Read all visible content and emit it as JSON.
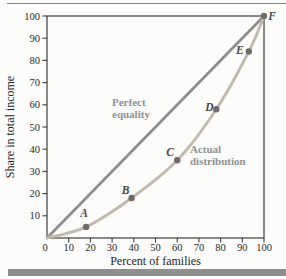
{
  "figure": {
    "background": "#fcfcfb",
    "top_rule_color": "#858585",
    "bottom_bar_color": "#8e8e8e"
  },
  "chart_data": {
    "type": "line",
    "title": "",
    "xlabel": "Percent of families",
    "ylabel": "Share in total income",
    "xlim": [
      0,
      100
    ],
    "ylim": [
      0,
      100
    ],
    "grid": false,
    "frame": true,
    "legend_position": "none",
    "xticks": [
      0,
      10,
      20,
      30,
      40,
      50,
      60,
      70,
      80,
      90,
      100
    ],
    "yticks": [
      10,
      20,
      30,
      40,
      50,
      60,
      70,
      80,
      90,
      100
    ],
    "series": [
      {
        "name": "Perfect equality",
        "shape": "straight-line",
        "color": "#8d8d8d",
        "points": [
          [
            0,
            0
          ],
          [
            100,
            100
          ]
        ]
      },
      {
        "name": "Actual distribution",
        "shape": "curve",
        "color": "#c1bbae",
        "points": [
          [
            0,
            0
          ],
          [
            18,
            5
          ],
          [
            39,
            18
          ],
          [
            60,
            35
          ],
          [
            78,
            58
          ],
          [
            93,
            84
          ],
          [
            100,
            100
          ]
        ]
      }
    ],
    "marked_points": [
      {
        "label": "A",
        "x": 18,
        "y": 5
      },
      {
        "label": "B",
        "x": 39,
        "y": 18
      },
      {
        "label": "C",
        "x": 60,
        "y": 35
      },
      {
        "label": "D",
        "x": 78,
        "y": 58
      },
      {
        "label": "E",
        "x": 93,
        "y": 84
      },
      {
        "label": "F",
        "x": 100,
        "y": 100
      }
    ],
    "marker_color": "#6f6b69",
    "annotations": [
      {
        "lines": [
          "Perfect",
          "equality"
        ],
        "x": 112,
        "y": 106,
        "color": "#8f8f8f"
      },
      {
        "lines": [
          "Actual",
          "distribution"
        ],
        "x": 190,
        "y": 153,
        "color": "#8f8f8f"
      }
    ],
    "axis_color": "#3c3c3c",
    "tick_label_color": "#262626",
    "axis_title_color": "#1d1d1d",
    "point_label_color": "#474747"
  }
}
